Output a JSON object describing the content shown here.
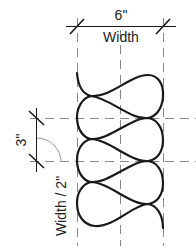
{
  "diagram": {
    "dimension_top": {
      "value": "6\"",
      "label": "Width"
    },
    "dimension_side": {
      "value": "3\"",
      "label": "Width / 2\""
    },
    "colors": {
      "stroke": "#1a1a1a",
      "guide": "#777777",
      "background": "#ffffff"
    }
  }
}
